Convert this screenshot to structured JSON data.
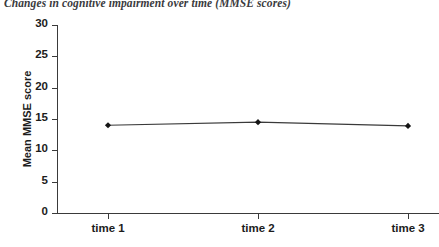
{
  "chart_data": {
    "type": "line",
    "title": "Changes in cognitive impairment over time (MMSE scores)",
    "xlabel": "",
    "ylabel": "Mean MMSE score",
    "categories": [
      "time 1",
      "time 2",
      "time 3"
    ],
    "values": [
      14.0,
      14.5,
      13.9
    ],
    "series": [
      {
        "name": "Mean MMSE score",
        "values": [
          14.0,
          14.5,
          13.9
        ],
        "marker": "filled-diamond",
        "line_color": "#3a3a3a",
        "marker_color": "#151515"
      }
    ],
    "ylim": [
      0,
      30
    ],
    "ytick_labels": [
      "0",
      "5",
      "10",
      "15",
      "20",
      "25",
      "30"
    ],
    "ytick_values": [
      0,
      5,
      10,
      15,
      20,
      25,
      30
    ],
    "grid": false,
    "legend": false,
    "legend_position": "none",
    "axis_color": "#3a3a3a",
    "background_color": "#ffffff"
  }
}
